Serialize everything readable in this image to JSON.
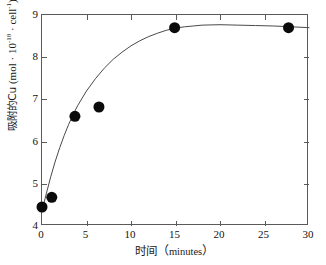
{
  "chart_data": {
    "type": "scatter",
    "title": "",
    "subtitle": "",
    "xlabel_cjk": "时间",
    "xlabel_open_paren": "（",
    "xlabel_unit": "minutes",
    "xlabel_close_paren": "）",
    "xlabel_full": "时间（minutes）",
    "ylabel_cjk": "吸附的Cu",
    "ylabel_unit_prefix": " (mol · 10",
    "ylabel_exp1": "-18",
    "ylabel_unit_mid": " · cell",
    "ylabel_exp2": "-1",
    "ylabel_unit_suffix": ")",
    "ylabel_full": "吸附的Cu (mol · 10-18 · cell-1)",
    "xlim": [
      0,
      30
    ],
    "ylim": [
      4,
      9
    ],
    "xticks": [
      0,
      5,
      10,
      15,
      20,
      25,
      30
    ],
    "yticks": [
      4,
      5,
      6,
      7,
      8,
      9
    ],
    "xtick_labels": [
      "0",
      "5",
      "10",
      "15",
      "20",
      "25",
      "30"
    ],
    "ytick_labels": [
      "4",
      "5",
      "6",
      "7",
      "8",
      "9"
    ],
    "grid": false,
    "legend": null,
    "frame": "box",
    "tick_direction": "in",
    "series": [
      {
        "name": "Cu adsorbed",
        "marker": "filled-circle",
        "marker_color": "#0b0b0b",
        "marker_size_px": 11,
        "x": [
          0.0,
          1.1,
          3.7,
          6.4,
          14.9,
          27.7
        ],
        "y": [
          4.45,
          4.68,
          6.6,
          6.82,
          8.7,
          8.7
        ]
      },
      {
        "name": "fitted saturation curve",
        "type": "line",
        "line_color": "#4a4a4a",
        "line_width_px": 1,
        "x": [
          0.0,
          0.5,
          1.0,
          1.5,
          2.0,
          2.5,
          3.0,
          3.5,
          4.0,
          5.0,
          6.0,
          7.0,
          8.0,
          9.0,
          10.0,
          11.0,
          12.0,
          13.0,
          14.0,
          15.0,
          16.0,
          17.0,
          18.0,
          20.0,
          22.0,
          24.0,
          26.0,
          28.0,
          30.0
        ],
        "y": [
          4.35,
          4.78,
          5.18,
          5.54,
          5.86,
          6.15,
          6.41,
          6.64,
          6.85,
          7.2,
          7.49,
          7.74,
          7.95,
          8.12,
          8.27,
          8.39,
          8.49,
          8.57,
          8.64,
          8.69,
          8.72,
          8.74,
          8.76,
          8.77,
          8.76,
          8.75,
          8.74,
          8.72,
          8.7
        ]
      }
    ],
    "colors": {
      "marker": "#0b0b0b",
      "curve": "#4a4a4a",
      "frame": "#5a5a5a",
      "text": "#121212",
      "background": "#ffffff"
    }
  }
}
